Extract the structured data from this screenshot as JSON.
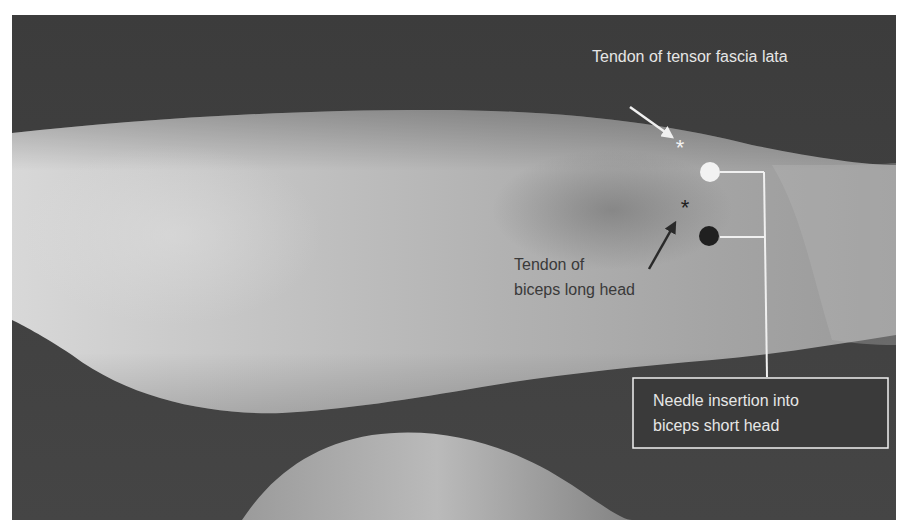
{
  "figure": {
    "colors": {
      "background": "#3d3d3d",
      "skin_light": "#c9c9c9",
      "skin_mid": "#a9a9a9",
      "label_light": "#e6e6e6",
      "label_dark": "#3a3a3a",
      "marker_white": "#f2f2f2",
      "marker_black": "#202020"
    },
    "annotations": {
      "tensor_fascia_lata": {
        "label": "Tendon of tensor fascia lata",
        "marker": "white-asterisk",
        "arrow": "white-arrow"
      },
      "biceps_long_head": {
        "label_line1": "Tendon of",
        "label_line2": "biceps long head",
        "marker": "black-asterisk",
        "arrow": "black-arrow"
      },
      "needle_insertion": {
        "label_line1": "Needle insertion into",
        "label_line2": "biceps short head",
        "markers": [
          "white-dot",
          "black-dot"
        ]
      }
    },
    "glyphs": {
      "asterisk": "*"
    }
  }
}
